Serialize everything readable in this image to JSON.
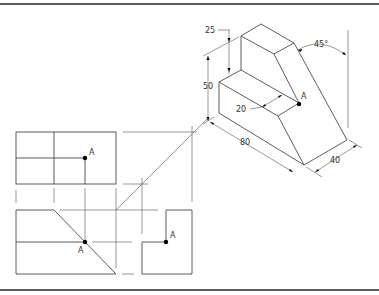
{
  "figure": {
    "type": "orthographic and isometric projection drawing",
    "point_label": "A",
    "isometric_view": {
      "dimensions": {
        "overall_height": "50",
        "upper_block_height": "25",
        "ledge_depth": "20",
        "length": "80",
        "width": "40",
        "slope_angle": "45°"
      }
    },
    "orthographic_views": {
      "top_view_point": "A",
      "front_view_point": "A",
      "side_view_point": "A"
    }
  }
}
